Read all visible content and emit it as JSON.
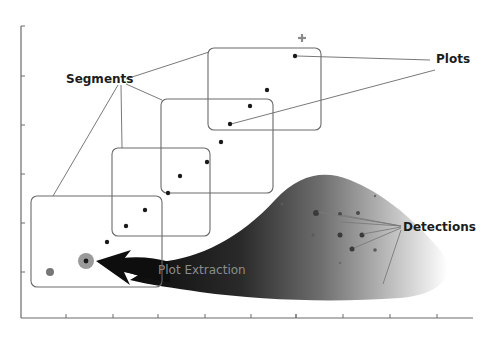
{
  "diagram": {
    "labels": {
      "segments": "Segments",
      "plots": "Plots",
      "detections": "Detections",
      "plot_extraction": "Plot Extraction"
    },
    "colors": {
      "line": "#5a5a5a",
      "box": "#6a6a6a",
      "dot": "#1a1a1a",
      "arrow_dark": "#111111",
      "halo": "#9a9a9a",
      "grey_dot": "#777777",
      "text": "#1c1c1c",
      "arrow_text": "#8c8c8c"
    },
    "axes": {
      "y_ticks": 6,
      "x_ticks": 9
    },
    "segments": [
      {
        "id": "segment-1",
        "x": 31,
        "y": 196,
        "w": 131,
        "h": 91
      },
      {
        "id": "segment-2",
        "x": 112,
        "y": 148,
        "w": 98,
        "h": 88
      },
      {
        "id": "segment-3",
        "x": 161,
        "y": 99,
        "w": 112,
        "h": 94
      },
      {
        "id": "segment-4",
        "x": 208,
        "y": 48,
        "w": 113,
        "h": 82
      }
    ],
    "plots": [
      {
        "x": 107,
        "y": 242
      },
      {
        "x": 126,
        "y": 226
      },
      {
        "x": 145,
        "y": 210
      },
      {
        "x": 168,
        "y": 193
      },
      {
        "x": 180,
        "y": 176
      },
      {
        "x": 207,
        "y": 162
      },
      {
        "x": 221,
        "y": 142
      },
      {
        "x": 230,
        "y": 124
      },
      {
        "x": 250,
        "y": 106
      },
      {
        "x": 267,
        "y": 90
      },
      {
        "x": 295,
        "y": 56
      }
    ],
    "extracted_plot": {
      "x": 86,
      "y": 261
    },
    "previous_plot": {
      "x": 50,
      "y": 272
    },
    "predicted_marker": {
      "x": 302,
      "y": 38
    },
    "detections": [
      {
        "x": 316,
        "y": 213,
        "r": 3
      },
      {
        "x": 340,
        "y": 214,
        "r": 2
      },
      {
        "x": 358,
        "y": 213,
        "r": 2
      },
      {
        "x": 340,
        "y": 235,
        "r": 2.5
      },
      {
        "x": 362,
        "y": 235,
        "r": 2.5
      },
      {
        "x": 352,
        "y": 249,
        "r": 2.5
      },
      {
        "x": 375,
        "y": 250,
        "r": 1.8
      },
      {
        "x": 313,
        "y": 235,
        "r": 1.5
      },
      {
        "x": 282,
        "y": 204,
        "r": 1.5
      },
      {
        "x": 375,
        "y": 196,
        "r": 1.2
      },
      {
        "x": 340,
        "y": 263,
        "r": 1.2
      }
    ]
  }
}
